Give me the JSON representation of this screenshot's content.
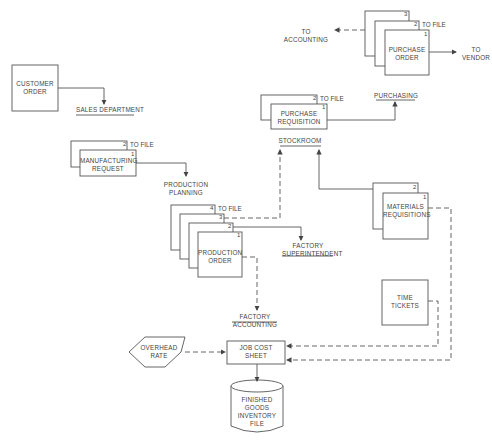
{
  "diagram": {
    "type": "document-flowchart",
    "documents": {
      "customer_order": {
        "label_1": "CUSTOMER",
        "label_2": "ORDER"
      },
      "manufacturing_request": {
        "label_1": "MANUFACTURING",
        "label_2": "REQUEST",
        "copies": [
          "1",
          "2"
        ],
        "to_file": "TO FILE"
      },
      "production_order": {
        "label_1": "PRODUCTION",
        "label_2": "ORDER",
        "copies": [
          "1",
          "2",
          "3",
          "4"
        ],
        "to_file": "TO FILE"
      },
      "purchase_requisition": {
        "label_1": "PURCHASE",
        "label_2": "REQUISITION",
        "copies": [
          "1",
          "2"
        ],
        "to_file": "TO FILE"
      },
      "purchase_order": {
        "label_1": "PURCHASE",
        "label_2": "ORDER",
        "copies": [
          "1",
          "2",
          "3"
        ],
        "to_file": "TO FILE"
      },
      "materials_requisitions": {
        "label_1": "MATERIALS",
        "label_2": "REQUISITIONS",
        "copies": [
          "1",
          "2"
        ]
      },
      "time_tickets": {
        "label_1": "TIME",
        "label_2": "TICKETS"
      },
      "job_cost_sheet": {
        "label_1": "JOB COST",
        "label_2": "SHEET"
      }
    },
    "departments": {
      "sales": "SALES DEPARTMENT",
      "production_planning_1": "PRODUCTION",
      "production_planning_2": "PLANNING",
      "factory_superintendent_1": "FACTORY",
      "factory_superintendent_2": "SUPERINTENDENT",
      "factory_accounting_1": "FACTORY",
      "factory_accounting_2": "ACCOUNTING",
      "stockroom": "STOCKROOM",
      "purchasing": "PURCHASING"
    },
    "destinations": {
      "to_accounting_1": "TO",
      "to_accounting_2": "ACCOUNTING",
      "to_vendor_1": "TO",
      "to_vendor_2": "VENDOR"
    },
    "decision": {
      "label_1": "OVERHEAD",
      "label_2": "RATE"
    },
    "file_store": {
      "label_1": "FINISHED",
      "label_2": "GOODS",
      "label_3": "INVENTORY",
      "label_4": "FILE"
    },
    "colors": {
      "line": "#555555",
      "background": "#ffffff"
    }
  }
}
